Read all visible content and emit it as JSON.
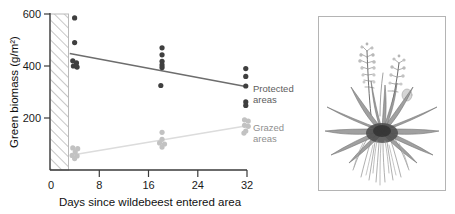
{
  "chart_data": {
    "type": "scatter",
    "title": "",
    "xlabel": "Days since wildebeest entered area",
    "ylabel": "Green biomass (g/m²)",
    "xlim": [
      0,
      32
    ],
    "ylim": [
      0,
      600
    ],
    "xticks": [
      0,
      8,
      16,
      24,
      32
    ],
    "yticks": [
      0,
      200,
      400,
      600
    ],
    "xtick_labels": [
      "0",
      "8",
      "16",
      "24",
      "32"
    ],
    "ytick_labels": [
      "0",
      "200",
      "400",
      "600"
    ],
    "grid": false,
    "legend_position": "right-inline",
    "annotations": [
      {
        "name": "hatched-band",
        "x_start": 0,
        "x_end": 3.0,
        "note": "diagonal hatched region before wildebeest entry"
      }
    ],
    "series": [
      {
        "name": "Protected areas",
        "color": "#3f3f3f",
        "marker": "filled-circle",
        "points": [
          {
            "x": 4.0,
            "y": 585
          },
          {
            "x": 4.0,
            "y": 490
          },
          {
            "x": 3.7,
            "y": 420
          },
          {
            "x": 4.3,
            "y": 412
          },
          {
            "x": 3.8,
            "y": 400
          },
          {
            "x": 4.4,
            "y": 396
          },
          {
            "x": 18.2,
            "y": 470
          },
          {
            "x": 18.2,
            "y": 443
          },
          {
            "x": 18.2,
            "y": 418
          },
          {
            "x": 18.2,
            "y": 404
          },
          {
            "x": 18.2,
            "y": 394
          },
          {
            "x": 18.0,
            "y": 325
          },
          {
            "x": 31.8,
            "y": 390
          },
          {
            "x": 31.8,
            "y": 360
          },
          {
            "x": 31.8,
            "y": 323
          },
          {
            "x": 31.8,
            "y": 262
          },
          {
            "x": 31.8,
            "y": 248
          }
        ],
        "trend_line": {
          "x1": 3.2,
          "y1": 448,
          "x2": 32.0,
          "y2": 320
        }
      },
      {
        "name": "Grazed areas",
        "color": "#c2c2c2",
        "marker": "filled-circle",
        "points": [
          {
            "x": 3.7,
            "y": 85
          },
          {
            "x": 4.5,
            "y": 82
          },
          {
            "x": 4.1,
            "y": 70
          },
          {
            "x": 3.6,
            "y": 56
          },
          {
            "x": 4.4,
            "y": 54
          },
          {
            "x": 4.0,
            "y": 44
          },
          {
            "x": 18.2,
            "y": 145
          },
          {
            "x": 18.2,
            "y": 118
          },
          {
            "x": 17.8,
            "y": 104
          },
          {
            "x": 18.6,
            "y": 100
          },
          {
            "x": 18.2,
            "y": 88
          },
          {
            "x": 31.6,
            "y": 193
          },
          {
            "x": 32.2,
            "y": 188
          },
          {
            "x": 31.6,
            "y": 172
          },
          {
            "x": 32.2,
            "y": 168
          },
          {
            "x": 31.8,
            "y": 150
          },
          {
            "x": 31.5,
            "y": 142
          }
        ],
        "trend_line": {
          "x1": 3.6,
          "y1": 58,
          "x2": 32.0,
          "y2": 170
        }
      }
    ]
  },
  "legend": {
    "protected": {
      "line1": "Protected",
      "line2": "areas",
      "color": "#6b6b6b"
    },
    "grazed": {
      "line1": "Grazed",
      "line2": "areas",
      "color": "#9a9a9a"
    }
  },
  "illustration": {
    "caption": "",
    "subject": "grass-plant-with-roots"
  }
}
